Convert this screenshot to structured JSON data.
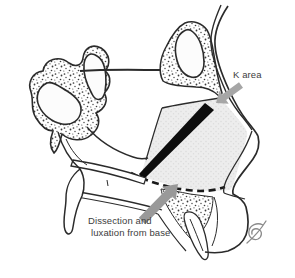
{
  "figure": {
    "type": "medical-line-illustration",
    "labels": {
      "k_area": "K area",
      "dissection_line1": "Dissection and",
      "dissection_line2": "luxation from base"
    },
    "icons": {
      "k_area_arrow": "arrow-down-left-icon",
      "dissection_arrow": "arrow-up-right-icon",
      "signature": "artist-monogram"
    },
    "colors": {
      "background": "#ffffff",
      "line": "#2b2b2b",
      "arrow_k": "#a6a6a6",
      "arrow_dissection": "#999999",
      "label_text": "#3d3d3d",
      "cartilage_fill": "#ededed",
      "chondrotomy_black": "#0d0d0d",
      "signature_gray": "#8a8a8a"
    }
  }
}
